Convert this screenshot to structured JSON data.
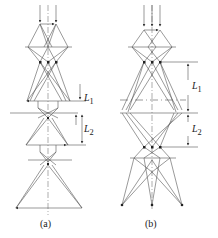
{
  "diagrams": [
    {
      "id": "a",
      "caption": "(a)",
      "labels": {
        "L1": "L",
        "L1_sub": "1",
        "L2": "L",
        "L2_sub": "2"
      }
    },
    {
      "id": "b",
      "caption": "(b)",
      "labels": {
        "L1": "L",
        "L1_sub": "1",
        "L2": "L",
        "L2_sub": "2"
      }
    }
  ],
  "colors": {
    "line": "#444444",
    "dash": "#777777"
  }
}
